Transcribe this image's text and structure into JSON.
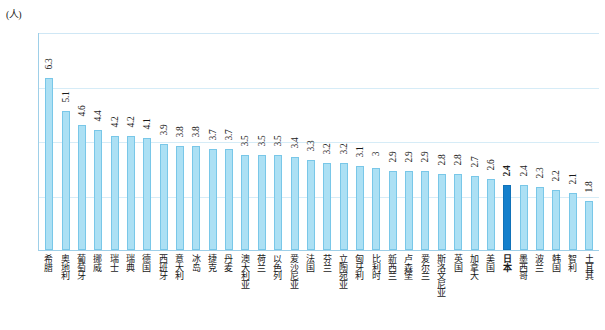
{
  "chart_data": {
    "type": "bar",
    "title": "",
    "xlabel": "",
    "ylabel": "(人)",
    "ylim": [
      0.0,
      8.0
    ],
    "ytick_labels": [
      "8.0",
      "6.0",
      "4.0",
      "2.0",
      "0.0"
    ],
    "ytick_values": [
      8.0,
      6.0,
      4.0,
      2.0,
      0.0
    ],
    "grid": true,
    "legend": "none",
    "highlight_category": "日本",
    "highlight_color": "#1580cc",
    "bar_color": "#ace0f4",
    "categories": [
      "希腊",
      "奥地利",
      "葡萄牙",
      "挪威",
      "瑞士",
      "瑞典",
      "德国",
      "西班牙",
      "意大利",
      "冰岛",
      "捷克",
      "丹麦",
      "澳大利亚",
      "荷兰",
      "以色列",
      "爱沙尼亚",
      "法国",
      "芬兰",
      "立陶宛亚",
      "匈牙利",
      "比利时",
      "新西兰",
      "卢森堡",
      "爱尔兰",
      "斯洛文尼亚",
      "英国",
      "加拿大",
      "美国",
      "日本",
      "墨西哥",
      "波兰",
      "韩国",
      "智利",
      "土耳其"
    ],
    "values": [
      6.3,
      5.1,
      4.6,
      4.4,
      4.2,
      4.2,
      4.1,
      3.9,
      3.8,
      3.8,
      3.7,
      3.7,
      3.5,
      3.5,
      3.5,
      3.4,
      3.3,
      3.2,
      3.2,
      3.1,
      3.0,
      2.9,
      2.9,
      2.9,
      2.8,
      2.8,
      2.7,
      2.6,
      2.4,
      2.4,
      2.3,
      2.2,
      2.1,
      1.8
    ],
    "value_labels": [
      "6.3",
      "5.1",
      "4.6",
      "4.4",
      "4.2",
      "4.2",
      "4.1",
      "3.9",
      "3.8",
      "3.8",
      "3.7",
      "3.7",
      "3.5",
      "3.5",
      "3.5",
      "3.4",
      "3.3",
      "3.2",
      "3.2",
      "3.1",
      "3",
      "2.9",
      "2.9",
      "2.9",
      "2.8",
      "2.8",
      "2.7",
      "2.6",
      "2.4",
      "2.4",
      "2.3",
      "2.2",
      "2.1",
      "1.8"
    ]
  }
}
